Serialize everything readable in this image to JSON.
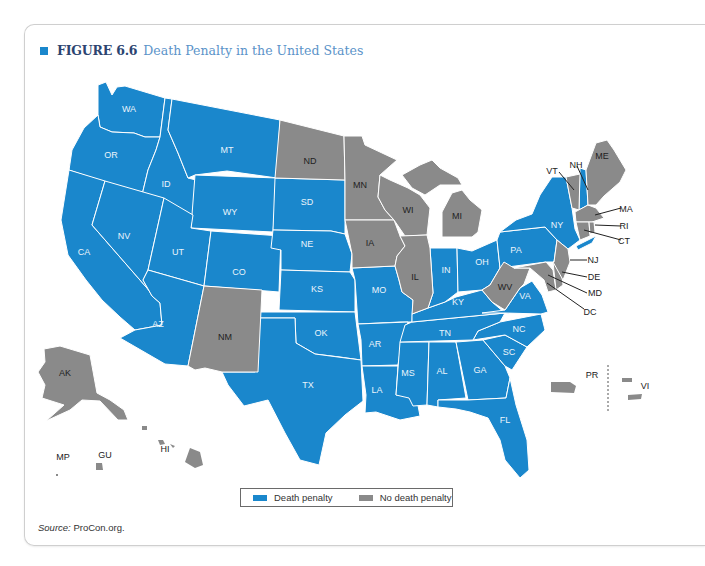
{
  "figure": {
    "number_label": "FIGURE 6.6",
    "title": "Death Penalty in the United States",
    "accent_color": "#1a87cc"
  },
  "colors": {
    "death_penalty": "#1a87cc",
    "no_death_penalty": "#8a8a8a",
    "border": "#ffffff"
  },
  "legend": {
    "items": [
      {
        "label": "Death penalty",
        "color": "#1a87cc"
      },
      {
        "label": "No death penalty",
        "color": "#8a8a8a"
      }
    ]
  },
  "source": {
    "prefix": "Source:",
    "text": " ProCon.org."
  },
  "map_data": {
    "death_penalty": [
      "WA",
      "OR",
      "CA",
      "ID",
      "NV",
      "MT",
      "WY",
      "UT",
      "AZ",
      "CO",
      "SD",
      "NE",
      "KS",
      "OK",
      "TX",
      "MO",
      "AR",
      "LA",
      "MS",
      "AL",
      "GA",
      "FL",
      "SC",
      "NC",
      "TN",
      "KY",
      "IN",
      "OH",
      "PA",
      "NY",
      "VA",
      "NH"
    ],
    "no_death_penalty": [
      "ND",
      "MN",
      "WI",
      "MI",
      "IA",
      "IL",
      "NM",
      "WV",
      "ME",
      "VT",
      "MA",
      "RI",
      "CT",
      "NJ",
      "DE",
      "MD",
      "DC",
      "AK",
      "HI",
      "PR",
      "VI",
      "GU",
      "MP"
    ]
  },
  "labels": {
    "WA": "WA",
    "OR": "OR",
    "CA": "CA",
    "ID": "ID",
    "NV": "NV",
    "MT": "MT",
    "WY": "WY",
    "UT": "UT",
    "AZ": "AZ",
    "CO": "CO",
    "NM": "NM",
    "ND": "ND",
    "SD": "SD",
    "NE": "NE",
    "KS": "KS",
    "OK": "OK",
    "TX": "TX",
    "MN": "MN",
    "IA": "IA",
    "MO": "MO",
    "AR": "AR",
    "LA": "LA",
    "WI": "WI",
    "IL": "IL",
    "MI": "MI",
    "IN": "IN",
    "OH": "OH",
    "KY": "KY",
    "TN": "TN",
    "MS": "MS",
    "AL": "AL",
    "GA": "GA",
    "FL": "FL",
    "SC": "SC",
    "NC": "NC",
    "VA": "VA",
    "WV": "WV",
    "PA": "PA",
    "NY": "NY",
    "VT": "VT",
    "NH": "NH",
    "ME": "ME",
    "MA": "MA",
    "RI": "RI",
    "CT": "CT",
    "NJ": "NJ",
    "DE": "DE",
    "MD": "MD",
    "DC": "DC",
    "AK": "AK",
    "HI": "HI",
    "MP": "MP",
    "GU": "GU",
    "PR": "PR",
    "VI": "VI"
  }
}
